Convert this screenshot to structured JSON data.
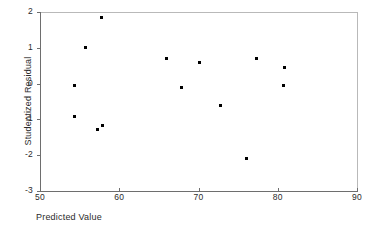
{
  "chart_data": {
    "type": "scatter",
    "title": "",
    "xlabel": "Predicted Value",
    "ylabel": "Studentized Residual",
    "xlim": [
      50,
      90
    ],
    "ylim": [
      -3,
      2
    ],
    "xticks": [
      "50",
      "60",
      "70",
      "80",
      "90"
    ],
    "xtick_values": [
      50,
      60,
      70,
      80,
      90
    ],
    "yticks": [
      "2",
      "1",
      "0",
      "-1",
      "-2",
      "-3"
    ],
    "ytick_values": [
      2,
      1,
      0,
      -1,
      -2,
      -3
    ],
    "grid": false,
    "legend": null,
    "marker_color": "#000000",
    "axis_color": "#6e6e6e",
    "points": [
      {
        "x": 57.8,
        "y": 1.86
      },
      {
        "x": 55.8,
        "y": 1.02
      },
      {
        "x": 54.3,
        "y": -0.04
      },
      {
        "x": 54.3,
        "y": -0.93
      },
      {
        "x": 57.9,
        "y": -1.16
      },
      {
        "x": 57.3,
        "y": -1.27
      },
      {
        "x": 65.9,
        "y": 0.69
      },
      {
        "x": 70.1,
        "y": 0.6
      },
      {
        "x": 67.9,
        "y": -0.12
      },
      {
        "x": 72.8,
        "y": -0.6
      },
      {
        "x": 76.0,
        "y": -2.1
      },
      {
        "x": 77.3,
        "y": 0.69
      },
      {
        "x": 80.8,
        "y": 0.46
      },
      {
        "x": 80.7,
        "y": -0.04
      }
    ]
  }
}
